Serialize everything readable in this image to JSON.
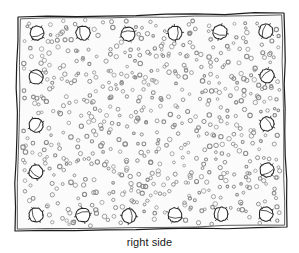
{
  "figure": {
    "caption": "right side",
    "title": "right side",
    "colors": {
      "background": "#ffffff",
      "panel_fill": "#fbfbfb",
      "border_stroke": "#1c1c1c",
      "large_circle_stroke": "#262626",
      "small_circle_stroke": "#8a8a8a",
      "caption_text": "#1a1a1a"
    },
    "panel": {
      "label": "panel-outline",
      "stroke_width": 1.2,
      "corners": [
        {
          "x": 18.0,
          "y": 17.0
        },
        {
          "x": 284.0,
          "y": 13.0
        },
        {
          "x": 287.0,
          "y": 227.0
        },
        {
          "x": 15.0,
          "y": 231.0
        }
      ],
      "inner_offset": 3.0
    },
    "large_circles": {
      "label": "fastener-circles",
      "count": 18,
      "radius": 7.0,
      "tick_count": 4,
      "items": [
        {
          "x": 37,
          "y": 33,
          "edge": "top"
        },
        {
          "x": 83,
          "y": 33,
          "edge": "top"
        },
        {
          "x": 128,
          "y": 34,
          "edge": "top"
        },
        {
          "x": 175,
          "y": 33,
          "edge": "top"
        },
        {
          "x": 220,
          "y": 32,
          "edge": "top"
        },
        {
          "x": 266,
          "y": 31,
          "edge": "top"
        },
        {
          "x": 36,
          "y": 77,
          "edge": "left"
        },
        {
          "x": 36,
          "y": 125,
          "edge": "left"
        },
        {
          "x": 36,
          "y": 172,
          "edge": "left"
        },
        {
          "x": 267,
          "y": 76,
          "edge": "right"
        },
        {
          "x": 267,
          "y": 124,
          "edge": "right"
        },
        {
          "x": 267,
          "y": 170,
          "edge": "right"
        },
        {
          "x": 36,
          "y": 215,
          "edge": "bottom"
        },
        {
          "x": 83,
          "y": 215,
          "edge": "bottom"
        },
        {
          "x": 129,
          "y": 216,
          "edge": "bottom"
        },
        {
          "x": 175,
          "y": 215,
          "edge": "bottom"
        },
        {
          "x": 221,
          "y": 214,
          "edge": "bottom"
        },
        {
          "x": 266,
          "y": 214,
          "edge": "bottom"
        }
      ]
    },
    "small_circles": {
      "label": "perforation-texture",
      "count": 640,
      "radius_min": 1.3,
      "radius_max": 2.3,
      "region": {
        "x": 22,
        "y": 20,
        "width": 258,
        "height": 206
      },
      "seed": 20240517
    }
  }
}
